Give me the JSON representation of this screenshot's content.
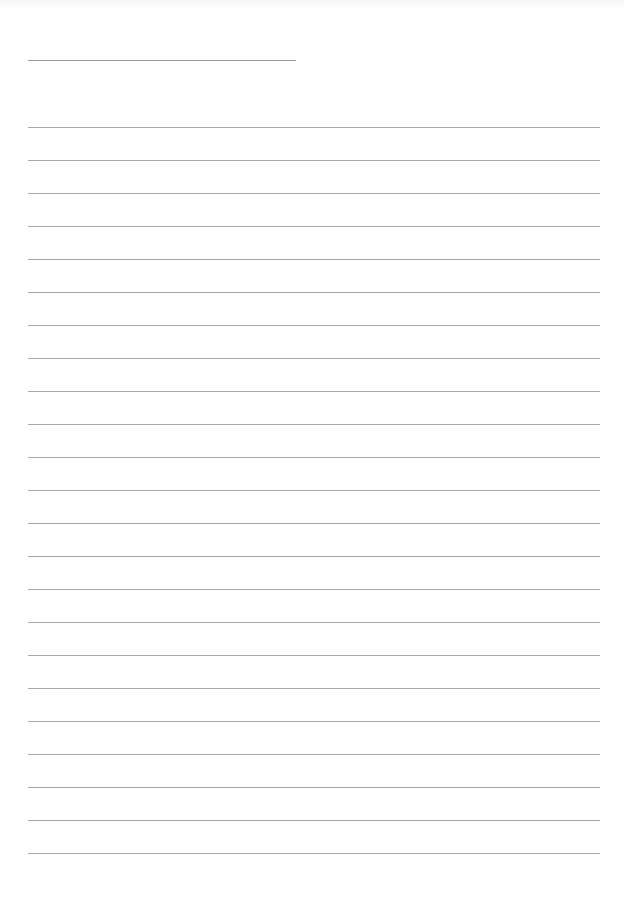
{
  "page": {
    "type": "lined-paper",
    "background_color": "#ffffff",
    "line_color": "#a8a8a8",
    "header_line": {
      "x": 28,
      "y": 60,
      "width": 268
    },
    "ruled_lines": {
      "count": 23,
      "x": 28,
      "width": 572,
      "first_y": 127,
      "spacing": 33
    },
    "text": ""
  }
}
